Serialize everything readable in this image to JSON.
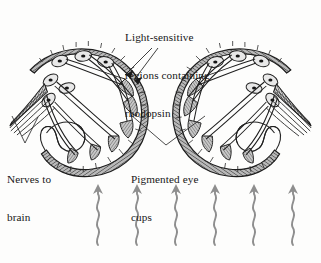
{
  "figure": {
    "background_color": "#fdfdfc",
    "ink_color": "#1a1a1a",
    "pigment_fill": "#9a9a9a",
    "light_ray_color": "#8e8e8e"
  },
  "labels": {
    "rhodopsin": {
      "line1": "Light-sensitive",
      "line2": "regions containing",
      "line3": "rhodopsin"
    },
    "nerves": {
      "line1": "Nerves to",
      "line2": "brain"
    },
    "pigment": {
      "line1": "Pigmented eye",
      "line2": "cups"
    }
  },
  "structures": {
    "eye_cup_left": "left-eye-cup",
    "eye_cup_right": "right-eye-cup",
    "nerve_bundle_left": "left-nerve-bundle",
    "nerve_bundle_right": "right-nerve-bundle",
    "photoreceptor_count_per_eye": 6,
    "light_ray_count": 6
  },
  "light_rays": {
    "direction": "upward",
    "x_positions": [
      98,
      137,
      176,
      215,
      254,
      293
    ],
    "top_y": 186,
    "bottom_y": 245,
    "amplitude": 3.2,
    "wavelength": 13
  }
}
